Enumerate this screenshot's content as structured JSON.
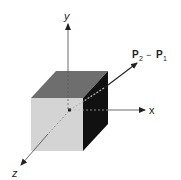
{
  "diagram": {
    "axes": {
      "x_label": "x",
      "y_label": "y",
      "z_label": "z"
    },
    "vector": {
      "label_p2": "P",
      "sub2": "2",
      "minus": "−",
      "label_p1": "P",
      "sub1": "1"
    },
    "colors": {
      "front_face": "#d4d4d4",
      "top_face": "#6e6e6e",
      "side_face": "#111111",
      "axis": "#333333"
    }
  }
}
